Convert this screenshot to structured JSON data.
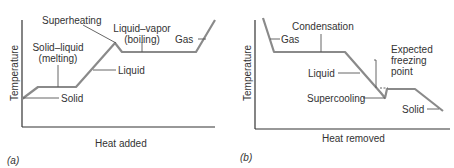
{
  "colors": {
    "curve": "#8a8a8a",
    "axis": "#333333",
    "leader": "#555555",
    "text": "#333333"
  },
  "panels": [
    {
      "tag": "(a)",
      "ylabel": "Temperature",
      "xlabel": "Heat added",
      "labels": {
        "superheating": "Superheating",
        "liquid_vapor_1": "Liquid–vapor",
        "liquid_vapor_2": "(boiling)",
        "gas": "Gas",
        "solid_liquid_1": "Solid–liquid",
        "solid_liquid_2": "(melting)",
        "liquid": "Liquid",
        "solid": "Solid"
      }
    },
    {
      "tag": "(b)",
      "ylabel": "Temperature",
      "xlabel": "Heat removed",
      "labels": {
        "condensation": "Condensation",
        "gas": "Gas",
        "expected_1": "Expected",
        "expected_2": "freezing",
        "expected_3": "point",
        "liquid": "Liquid",
        "supercooling": "Supercooling",
        "solid": "Solid"
      }
    }
  ]
}
